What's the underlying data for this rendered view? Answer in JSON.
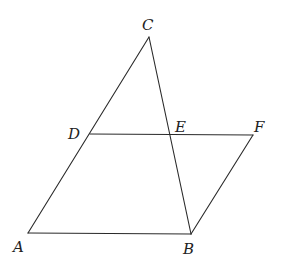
{
  "diagram": {
    "type": "geometry",
    "points": {
      "A": {
        "x": 28,
        "y": 233,
        "label": "A",
        "lx": 13,
        "ly": 252
      },
      "B": {
        "x": 191,
        "y": 234,
        "label": "B",
        "lx": 183,
        "ly": 254
      },
      "C": {
        "x": 149,
        "y": 37,
        "label": "C",
        "lx": 142,
        "ly": 30
      },
      "D": {
        "x": 90,
        "y": 134,
        "label": "D",
        "lx": 68,
        "ly": 139
      },
      "E": {
        "x": 171,
        "y": 134,
        "label": "E",
        "lx": 175,
        "ly": 132
      },
      "F": {
        "x": 253,
        "y": 135,
        "label": "F",
        "lx": 254,
        "ly": 132
      }
    },
    "segments": [
      {
        "from": "A",
        "to": "C"
      },
      {
        "from": "C",
        "to": "B"
      },
      {
        "from": "A",
        "to": "B"
      },
      {
        "from": "D",
        "to": "F"
      },
      {
        "from": "F",
        "to": "B"
      }
    ],
    "labels": [
      "A",
      "B",
      "C",
      "D",
      "E",
      "F"
    ],
    "stroke_color": "#2a2a2a",
    "background": "#ffffff"
  }
}
